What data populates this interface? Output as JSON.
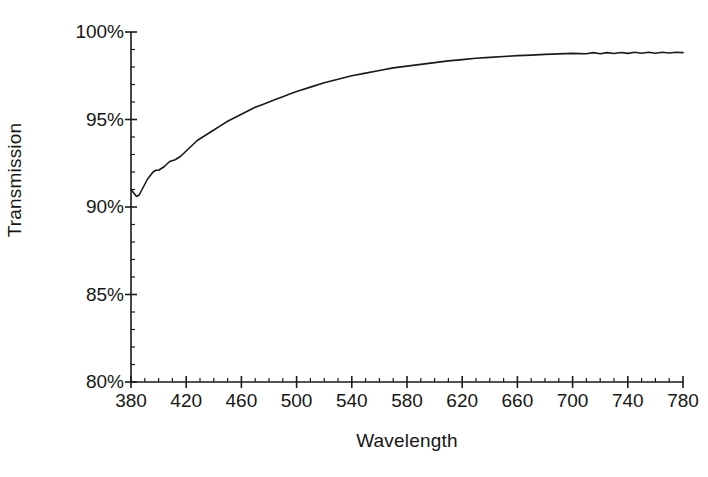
{
  "chart_data": {
    "type": "line",
    "title": "",
    "xlabel": "Wavelength",
    "ylabel": "Transmission",
    "xlim": [
      380,
      780
    ],
    "ylim": [
      80,
      100
    ],
    "xticks": [
      380,
      420,
      460,
      500,
      540,
      580,
      620,
      660,
      700,
      740,
      780
    ],
    "xtick_labels": [
      "380",
      "420",
      "460",
      "500",
      "540",
      "580",
      "620",
      "660",
      "700",
      "740",
      "780"
    ],
    "x_minor_tick_step": 10,
    "yticks": [
      80,
      85,
      90,
      95,
      100
    ],
    "ytick_labels": [
      "80%",
      "85%",
      "90%",
      "95%",
      "100%"
    ],
    "y_minor_tick_step": 1,
    "grid": false,
    "legend": null,
    "line_color": "#1a1a1a",
    "line_width": 1.6,
    "background": "#ffffff",
    "y_unit": "%",
    "series": [
      {
        "name": "Transmission",
        "x": [
          380,
          382,
          384,
          386,
          388,
          390,
          392,
          394,
          396,
          398,
          400,
          404,
          408,
          412,
          416,
          420,
          424,
          428,
          432,
          436,
          440,
          445,
          450,
          455,
          460,
          465,
          470,
          475,
          480,
          485,
          490,
          495,
          500,
          510,
          520,
          530,
          540,
          550,
          560,
          570,
          580,
          590,
          600,
          610,
          620,
          630,
          640,
          650,
          660,
          670,
          680,
          690,
          700,
          710,
          715,
          720,
          725,
          730,
          735,
          740,
          745,
          750,
          755,
          760,
          765,
          770,
          775,
          780
        ],
        "y": [
          91.0,
          90.8,
          90.6,
          90.7,
          91.0,
          91.3,
          91.6,
          91.8,
          92.0,
          92.1,
          92.1,
          92.3,
          92.6,
          92.7,
          92.9,
          93.2,
          93.5,
          93.8,
          94.0,
          94.2,
          94.4,
          94.65,
          94.9,
          95.1,
          95.3,
          95.5,
          95.7,
          95.85,
          96.0,
          96.15,
          96.3,
          96.45,
          96.6,
          96.85,
          97.1,
          97.3,
          97.5,
          97.65,
          97.8,
          97.95,
          98.05,
          98.15,
          98.25,
          98.35,
          98.42,
          98.5,
          98.55,
          98.6,
          98.65,
          98.68,
          98.72,
          98.75,
          98.78,
          98.76,
          98.82,
          98.76,
          98.82,
          98.77,
          98.83,
          98.78,
          98.84,
          98.79,
          98.84,
          98.79,
          98.84,
          98.8,
          98.84,
          98.82
        ]
      }
    ]
  }
}
